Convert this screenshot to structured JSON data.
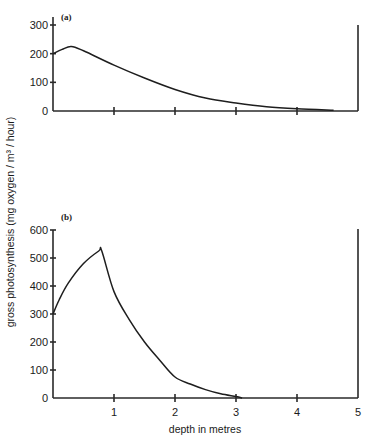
{
  "chart_data": [
    {
      "type": "line",
      "panel_label": "(a)",
      "xlabel": "depth in metres",
      "ylabel": "gross photosynthesis (mg oxygen / m³ / hour)",
      "xlim": [
        0,
        5
      ],
      "ylim": [
        0,
        300
      ],
      "yticks": [
        0,
        100,
        200,
        300
      ],
      "xticks": [
        1,
        2,
        3,
        4
      ],
      "x": [
        0,
        0.15,
        0.3,
        0.5,
        1.0,
        1.5,
        2.0,
        2.5,
        3.0,
        3.5,
        4.0,
        4.6
      ],
      "values": [
        200,
        215,
        225,
        210,
        160,
        115,
        75,
        45,
        28,
        15,
        8,
        3
      ]
    },
    {
      "type": "line",
      "panel_label": "(b)",
      "xlabel": "depth in metres",
      "ylabel": "gross photosynthesis (mg oxygen / m³ / hour)",
      "xlim": [
        0,
        5
      ],
      "ylim": [
        0,
        600
      ],
      "yticks": [
        0,
        100,
        200,
        300,
        400,
        500,
        600
      ],
      "xticks": [
        1,
        2,
        3,
        4,
        5
      ],
      "x": [
        0,
        0.1,
        0.25,
        0.5,
        0.75,
        0.8,
        1.0,
        1.25,
        1.5,
        1.75,
        2.0,
        2.25,
        2.5,
        2.75,
        3.0,
        3.1
      ],
      "values": [
        300,
        350,
        410,
        480,
        525,
        525,
        380,
        280,
        200,
        135,
        75,
        50,
        30,
        15,
        5,
        0
      ]
    }
  ],
  "labels": {
    "xlabel": "depth in metres",
    "ylabel": "gross photosynthesis (mg oxygen / m³ / hour)",
    "panel_a": "(a)",
    "panel_b": "(b)"
  }
}
